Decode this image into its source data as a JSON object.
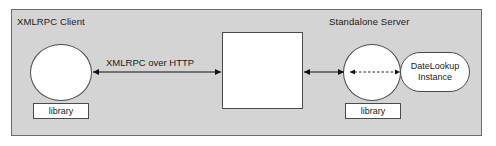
{
  "diagram": {
    "panel": {
      "background_color": "#d4d4d4",
      "border_color": "#6b6b6b"
    },
    "zones": [
      {
        "id": "client",
        "label": "XMLRPC Client"
      },
      {
        "id": "server",
        "label": "Standalone Server"
      }
    ],
    "nodes": [
      {
        "id": "client-circle",
        "label": "",
        "shape": "circle"
      },
      {
        "id": "client-library",
        "label": "library",
        "shape": "rect"
      },
      {
        "id": "center-box",
        "label": "",
        "shape": "rect"
      },
      {
        "id": "server-circle",
        "label": "",
        "shape": "circle"
      },
      {
        "id": "server-library",
        "label": "library",
        "shape": "rect"
      },
      {
        "id": "datelookup",
        "label_line1": "DateLookup",
        "label_line2": "Instance",
        "shape": "stadium"
      }
    ],
    "connectors": [
      {
        "id": "http-link",
        "label": "XMLRPC over HTTP",
        "style": "solid",
        "arrowheads": "both",
        "from": "client-circle",
        "to": "center-box"
      },
      {
        "id": "server-link",
        "label": "",
        "style": "solid",
        "arrowheads": "both",
        "from": "center-box",
        "to": "server-circle"
      },
      {
        "id": "instance-link",
        "label": "",
        "style": "dashed",
        "arrowheads": "both",
        "from": "server-circle",
        "to": "datelookup"
      }
    ],
    "colors": {
      "stroke": "#4a4a4a",
      "arrow": "#1a1a1a",
      "node_fill": "#ffffff",
      "text": "#1a1a1a"
    }
  }
}
